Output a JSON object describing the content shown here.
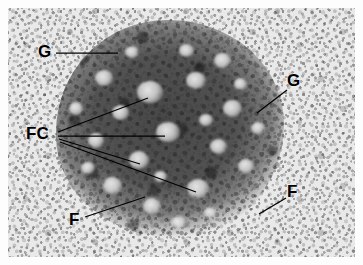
{
  "figure": {
    "kind": "electron-micrograph",
    "width": 363,
    "height": 265,
    "background_color": "#ffffff",
    "plate_tone": "#e9e9e9",
    "label_color": "#000000",
    "leader_color": "#000000"
  },
  "annotations": [
    {
      "id": "g-top-left",
      "text": "G",
      "meaning": "granular-component",
      "label_x": 38,
      "label_y": 43,
      "font_size": 17,
      "leader": "M56,53 L118,53"
    },
    {
      "id": "g-right",
      "text": "G",
      "meaning": "granular-component",
      "label_x": 287,
      "label_y": 72,
      "font_size": 17,
      "leader": "M287,90 L257,113"
    },
    {
      "id": "fc-left",
      "text": "FC",
      "meaning": "fibrillar-centers",
      "label_x": 26,
      "label_y": 125,
      "font_size": 17,
      "leader": "M58,132 L148,98 M58,136 L165,136 M59,139 L140,164 M60,142 L196,192"
    },
    {
      "id": "f-bottom-left",
      "text": "F",
      "meaning": "fibrillar-component",
      "label_x": 69,
      "label_y": 211,
      "font_size": 17,
      "leader": "M85,217 L145,197"
    },
    {
      "id": "f-right",
      "text": "F",
      "meaning": "fibrillar-component",
      "label_x": 287,
      "label_y": 183,
      "font_size": 17,
      "leader": "M286,198 L259,214"
    }
  ],
  "fibrillar_centers": [
    {
      "x": 150,
      "y": 92,
      "w": 26,
      "h": 22
    },
    {
      "x": 168,
      "y": 132,
      "w": 24,
      "h": 20
    },
    {
      "x": 139,
      "y": 160,
      "w": 20,
      "h": 18
    },
    {
      "x": 198,
      "y": 188,
      "w": 22,
      "h": 19
    },
    {
      "x": 104,
      "y": 78,
      "w": 18,
      "h": 16
    },
    {
      "x": 120,
      "y": 112,
      "w": 17,
      "h": 15
    },
    {
      "x": 96,
      "y": 140,
      "w": 16,
      "h": 15
    },
    {
      "x": 112,
      "y": 185,
      "w": 19,
      "h": 17
    },
    {
      "x": 152,
      "y": 206,
      "w": 18,
      "h": 16
    },
    {
      "x": 196,
      "y": 80,
      "w": 20,
      "h": 17
    },
    {
      "x": 222,
      "y": 60,
      "w": 17,
      "h": 15
    },
    {
      "x": 232,
      "y": 108,
      "w": 19,
      "h": 17
    },
    {
      "x": 218,
      "y": 146,
      "w": 17,
      "h": 15
    },
    {
      "x": 246,
      "y": 166,
      "w": 16,
      "h": 14
    },
    {
      "x": 186,
      "y": 50,
      "w": 15,
      "h": 13
    },
    {
      "x": 76,
      "y": 108,
      "w": 14,
      "h": 13
    },
    {
      "x": 88,
      "y": 168,
      "w": 14,
      "h": 12
    },
    {
      "x": 178,
      "y": 222,
      "w": 15,
      "h": 13
    },
    {
      "x": 258,
      "y": 128,
      "w": 14,
      "h": 12
    },
    {
      "x": 206,
      "y": 120,
      "w": 14,
      "h": 12
    },
    {
      "x": 132,
      "y": 52,
      "w": 14,
      "h": 12
    },
    {
      "x": 240,
      "y": 84,
      "w": 13,
      "h": 12
    },
    {
      "x": 160,
      "y": 176,
      "w": 13,
      "h": 11
    },
    {
      "x": 210,
      "y": 212,
      "w": 13,
      "h": 11
    }
  ]
}
